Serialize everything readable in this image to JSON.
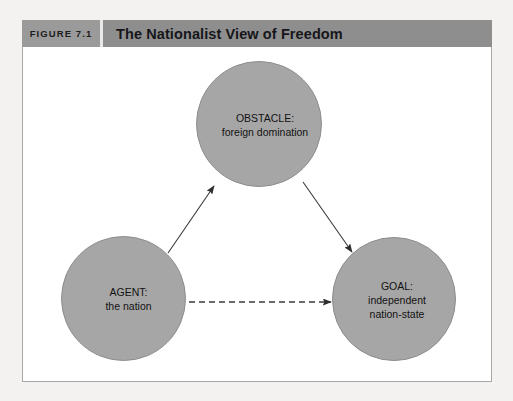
{
  "header": {
    "figure_number": "FIGURE 7.1",
    "title": "The Nationalist View of Freedom"
  },
  "colors": {
    "page_background": "#f3f2f0",
    "header_bar": "#8e8e8e",
    "figure_number_cell": "#9a9a9a",
    "panel_background": "#ffffff",
    "panel_border": "#a9a8a6",
    "node_fill": "#a6a6a6",
    "node_stroke": "#8d8d8d",
    "connector": "#3a3a3a",
    "text": "#121212"
  },
  "diagram": {
    "type": "concept-diagram",
    "nodes": [
      {
        "id": "obstacle",
        "lines": [
          "OBSTACLE:",
          "foreign domination"
        ],
        "cx": 259,
        "cy": 124,
        "r": 63
      },
      {
        "id": "agent",
        "lines": [
          "AGENT:",
          "the nation"
        ],
        "cx": 123,
        "cy": 298,
        "r": 62
      },
      {
        "id": "goal",
        "lines": [
          "GOAL:",
          "independent",
          "nation-state"
        ],
        "cx": 394,
        "cy": 299,
        "r": 62
      }
    ],
    "connectors": [
      {
        "id": "agent-to-obstacle",
        "from": "agent",
        "to": "obstacle",
        "style": "solid",
        "arrow": "end"
      },
      {
        "id": "obstacle-to-goal",
        "from": "obstacle",
        "to": "goal",
        "style": "solid",
        "arrow": "end"
      },
      {
        "id": "agent-to-goal",
        "from": "agent",
        "to": "goal",
        "style": "dashed",
        "arrow": "end"
      }
    ]
  }
}
